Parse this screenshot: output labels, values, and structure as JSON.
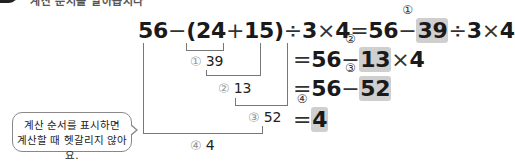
{
  "header": {
    "text": "계산 순서를 알아봅시다"
  },
  "expression": {
    "a": "56",
    "minus": "−",
    "open": "(",
    "b": "24",
    "plus": "+",
    "c": "15",
    "close": ")",
    "div": "÷",
    "d": "3",
    "times": "×",
    "e": "4",
    "equals": "="
  },
  "steps": [
    {
      "mark": "①",
      "lhs": "56",
      "op": "−",
      "value": "39",
      "rest_div": "÷",
      "rest_3": "3",
      "rest_times": "×",
      "rest_4": "4"
    },
    {
      "mark": "②",
      "lhs": "56",
      "op": "−",
      "value": "13",
      "rest_times": "×",
      "rest_4": "4"
    },
    {
      "mark": "③",
      "lhs": "56",
      "op": "−",
      "value": "52"
    },
    {
      "mark": "④",
      "value": "4"
    }
  ],
  "sub_results": [
    {
      "mark": "①",
      "value": "39"
    },
    {
      "mark": "②",
      "value": "13"
    },
    {
      "mark": "③",
      "value": "52"
    },
    {
      "mark": "④",
      "value": "4"
    }
  ],
  "bubble": {
    "line1": "계산 순서를 표시하면",
    "line2": "계산할 때 헷갈리지 않아요."
  }
}
